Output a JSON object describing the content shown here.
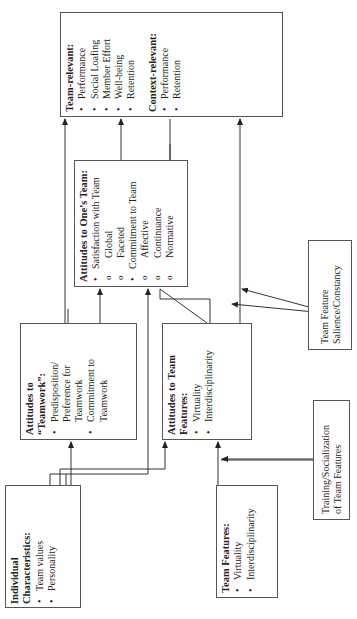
{
  "diagram": {
    "orientation": "rotated-90-ccw",
    "boxes": {
      "individual": {
        "title": "Individual Characteristics:",
        "items": [
          {
            "type": "bullet",
            "text": "Team values"
          },
          {
            "type": "bullet",
            "text": "Personality"
          },
          {
            "type": "sub",
            "text": "Extraversion"
          },
          {
            "type": "sub",
            "text": "Neuroticism"
          },
          {
            "type": "sub",
            "text": "Agreeableness"
          },
          {
            "type": "sub",
            "text": "Boldness"
          },
          {
            "type": "sub",
            "text": "Collectivism"
          },
          {
            "type": "bullet",
            "text": "Cognitive Style"
          },
          {
            "type": "bullet",
            "text": "Culture"
          }
        ]
      },
      "team_features": {
        "title": "Team Features:",
        "items": [
          {
            "type": "bullet",
            "text": "Virtuality"
          },
          {
            "type": "bullet",
            "text": "Interdisciplinarity"
          }
        ]
      },
      "training": {
        "text_line1": "Training/Socialization",
        "text_line2": "of Team Features"
      },
      "attitudes_teamwork": {
        "title": "Attitudes to “Teamwork”:",
        "items": [
          {
            "type": "bullet",
            "text": "Predisposition/ Preference for Teamwork"
          },
          {
            "type": "bullet",
            "text": "Commitment to Teamwork"
          }
        ]
      },
      "attitudes_team_features": {
        "title": "Attitudes to Team Features:",
        "items": [
          {
            "type": "bullet",
            "text": "Virtuality"
          },
          {
            "type": "bullet",
            "text": "Interdisciplinarity"
          }
        ]
      },
      "salience": {
        "text_line1": "Team Feature",
        "text_line2": "Salience/Constancy"
      },
      "attitudes_ones_team": {
        "title": "Attitudes to One’s Team:",
        "items": [
          {
            "type": "bullet",
            "text": "Satisfaction with Team"
          },
          {
            "type": "sub",
            "text": "Global"
          },
          {
            "type": "sub",
            "text": "Faceted"
          },
          {
            "type": "bullet",
            "text": "Commitment to Team"
          },
          {
            "type": "sub",
            "text": "Affective"
          },
          {
            "type": "sub",
            "text": "Continuance"
          },
          {
            "type": "sub",
            "text": "Normative"
          }
        ]
      },
      "outcomes": {
        "team_title": "Team-relevant:",
        "team_items": [
          "Performance",
          "Social Loafing",
          "Member Effort",
          "Well-being",
          "Retention"
        ],
        "context_title": "Context-relevant:",
        "context_items": [
          "Performance",
          "Retention"
        ]
      }
    }
  }
}
